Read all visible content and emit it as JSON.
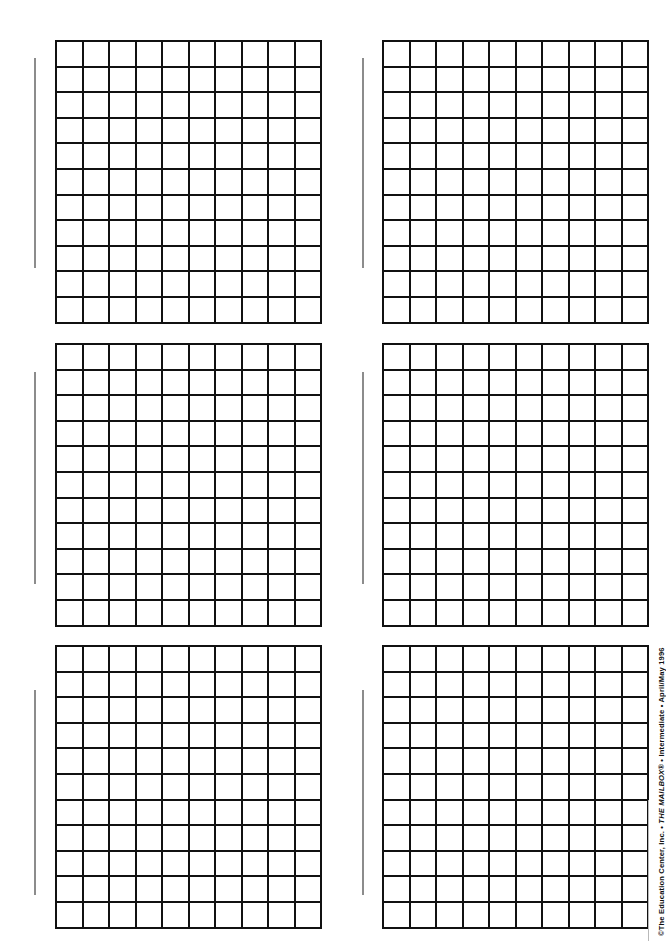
{
  "page": {
    "width": 658,
    "height": 941,
    "background_color": "#ffffff"
  },
  "credit": {
    "full_text": "©The Education Center, Inc. • THE MAILBOX® • Intermediate • April/May 1996",
    "copyright_symbol": "©",
    "publisher": "The Education Center, Inc.",
    "separator": "•",
    "publication": "THE MAILBOX®",
    "level": "Intermediate",
    "issue": "April/May 1996",
    "orientation": "vertical-rotated-90-ccw",
    "color": "#101010"
  },
  "grid_spec": {
    "columns": 10,
    "rows": 11,
    "cell_count": 110,
    "cell_width_px": 24.5,
    "cell_height_px": 23.6,
    "line_color": "#111111",
    "line_width_px": 2.4,
    "cell_fill": "#ffffff"
  },
  "tick_rule": {
    "color": "#8c8c8c",
    "width_px": 1.6
  },
  "margin_rule": {
    "color": "#b9b9b9",
    "width_px": 1.2
  },
  "grids": [
    {
      "id": "grid-1",
      "label": "grid-top-left",
      "row": 1,
      "column": 1,
      "left": 55,
      "top": 40,
      "tick_left": 34,
      "tick_top": 58,
      "tick_height": 210
    },
    {
      "id": "grid-2",
      "label": "grid-top-right",
      "row": 1,
      "column": 2,
      "left": 382,
      "top": 40,
      "tick_left": 362,
      "tick_top": 58,
      "tick_height": 210
    },
    {
      "id": "grid-3",
      "label": "grid-middle-left",
      "row": 2,
      "column": 1,
      "left": 55,
      "top": 343,
      "tick_left": 34,
      "tick_top": 372,
      "tick_height": 212
    },
    {
      "id": "grid-4",
      "label": "grid-middle-right",
      "row": 2,
      "column": 2,
      "left": 382,
      "top": 343,
      "tick_left": 362,
      "tick_top": 372,
      "tick_height": 212
    },
    {
      "id": "grid-5",
      "label": "grid-bottom-left",
      "row": 3,
      "column": 1,
      "left": 55,
      "top": 645,
      "tick_left": 34,
      "tick_top": 690,
      "tick_height": 205
    },
    {
      "id": "grid-6",
      "label": "grid-bottom-right",
      "row": 3,
      "column": 2,
      "left": 382,
      "top": 645,
      "tick_left": 362,
      "tick_top": 690,
      "tick_height": 205
    }
  ],
  "margin_rules": [
    {
      "id": "margin-rule-right",
      "left": 648,
      "top": 800,
      "height": 141
    }
  ]
}
